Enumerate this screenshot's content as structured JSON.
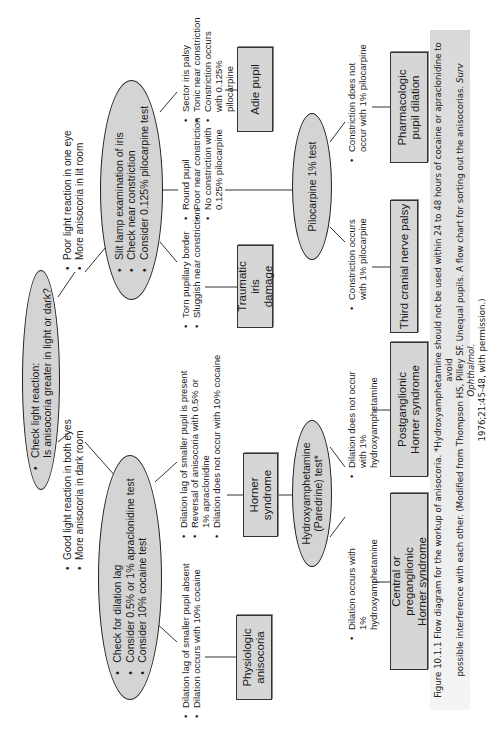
{
  "diagram": {
    "start": {
      "lines": [
        "Check light reaction:",
        "Is anisocoria greater in light or dark?"
      ]
    },
    "branch_dark": {
      "label": [
        "Good light reaction in both eyes",
        "More anisocoria in dark room"
      ],
      "test": [
        "Check for dilation lag",
        "Consider 0.5% or 1% apraclonidine test",
        "Consider 10% cocaine test"
      ],
      "outcome_physiologic": {
        "criteria": [
          "Dilation lag of smaller pupil absent",
          "Dilation occurs with 10% cocaine"
        ],
        "result": "Physiologic anisocoria"
      },
      "outcome_horner": {
        "criteria": [
          "Dilation lag of smaller pupil is present",
          "Reversal of anisocoria with 0.5% or 1% apraclonidine",
          "Dilation does not occur with 10% cocaine"
        ],
        "result": "Horner syndrome"
      },
      "hydroxy_test": [
        "Hydroxyamphetamine",
        "(Paredrine) test*"
      ],
      "outcome_central": {
        "criteria": [
          "Dilation occurs with 1% hydroxyamphetamine"
        ],
        "result": "Central or preganglionic Horner syndrome"
      },
      "outcome_postganglionic": {
        "criteria": [
          "Dilation does not occur with 1% hydroxyamphetamine"
        ],
        "result": "Postganglionic Horner syndrome"
      }
    },
    "branch_light": {
      "label": [
        "Poor light reaction in one eye",
        "More anisocoria in lit room"
      ],
      "test": [
        "Slit lamp examination of iris",
        "Check near constriction",
        "Consider 0.125% pilocarpine test"
      ],
      "outcome_traumatic": {
        "criteria": [
          "Torn pupillary border",
          "Sluggish near constriction"
        ],
        "result": "Traumatic iris damage"
      },
      "outcome_round": {
        "criteria": [
          "Round pupil",
          "Poor near constriction",
          "No constriction with 0.125% pilocarpine"
        ]
      },
      "outcome_adie": {
        "criteria": [
          "Sector iris palsy",
          "Tonic near constriction",
          "Constriction occurs with 0.125% pilocarpine"
        ],
        "result": "Adie pupil"
      },
      "pilocarpine_test": "Pilocarpine 1% test",
      "outcome_third": {
        "criteria": [
          "Constriction occurs with 1% pilocarpine"
        ],
        "result": "Third cranial nerve palsy"
      },
      "outcome_pharm": {
        "criteria": [
          "Constriction does not occur with 1% pilocarpine"
        ],
        "result": "Pharmacologic pupil dilation"
      }
    }
  },
  "caption": {
    "line1": "Figure 10.1.1  Flow diagram for the workup of anisocoria. *Hydroxyamphetamine should not be used within 24 to 48 hours of cocaine or apraclonidine to avoid",
    "line2": "possible interference with each other. (Modified from Thompson HS, Pilley SF. Unequal pupils. A flow chart for sorting out the anisocorias.",
    "journal": "Surv Ophthalmol.",
    "line3": "1976;21:45-48, with permission.)"
  }
}
